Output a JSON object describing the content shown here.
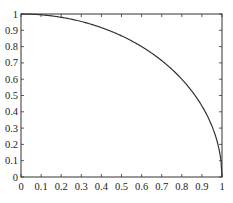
{
  "chart_data": {
    "type": "line",
    "title": "",
    "xlabel": "",
    "ylabel": "",
    "xlim": [
      0,
      1
    ],
    "ylim": [
      0,
      1
    ],
    "grid": false,
    "legend": null,
    "x_ticks": [
      "0",
      "0.1",
      "0.2",
      "0.3",
      "0.4",
      "0.5",
      "0.6",
      "0.7",
      "0.8",
      "0.9",
      "1"
    ],
    "y_ticks": [
      "0",
      "0.1",
      "0.2",
      "0.3",
      "0.4",
      "0.5",
      "0.6",
      "0.7",
      "0.8",
      "0.9",
      "1"
    ],
    "series": [
      {
        "name": "quarter-circle",
        "color": "#333333",
        "x": [
          0,
          0.1,
          0.2,
          0.3,
          0.4,
          0.5,
          0.6,
          0.7,
          0.8,
          0.9,
          0.95,
          0.98,
          1.0
        ],
        "y": [
          1.0,
          0.995,
          0.98,
          0.954,
          0.917,
          0.866,
          0.8,
          0.714,
          0.6,
          0.436,
          0.312,
          0.199,
          0.0
        ]
      }
    ]
  },
  "layout": {
    "plot_left": 21,
    "plot_right": 222,
    "plot_top": 14,
    "plot_bottom": 177
  }
}
